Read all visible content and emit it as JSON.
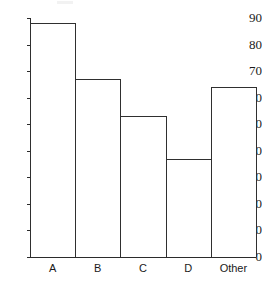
{
  "chart_data": {
    "type": "bar",
    "title": "",
    "subtitle": "",
    "xlabel": "",
    "ylabel": "",
    "categories": [
      "A",
      "B",
      "C",
      "D",
      "Other"
    ],
    "values": [
      88,
      67,
      53,
      37,
      64
    ],
    "ylim": [
      0,
      90
    ],
    "y_ticks": [
      0,
      10,
      20,
      30,
      40,
      50,
      60,
      70,
      80,
      90
    ],
    "y_tick_labels": [
      "0",
      "10",
      "20",
      "30",
      "40",
      "50",
      "60",
      "70",
      "80",
      "90"
    ],
    "grid": false,
    "legend": false,
    "legend_position": "none",
    "annotations": [],
    "style": {
      "bar_fill": "#ffffff",
      "bar_border": "#2f2f2f",
      "axis_color": "#2b2b2b",
      "text_color": "#1a1a1a",
      "background": "#ffffff",
      "bars_contiguous": true
    }
  }
}
